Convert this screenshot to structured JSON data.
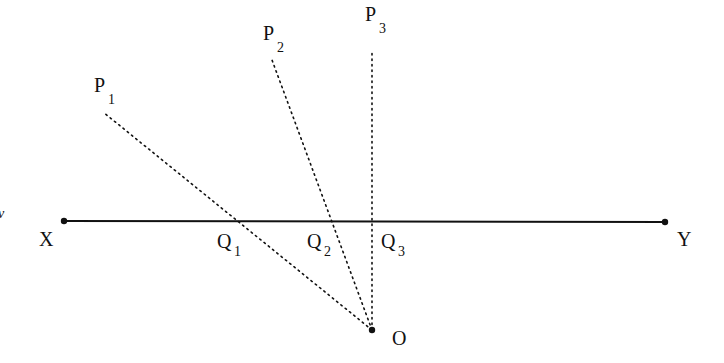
{
  "diagram": {
    "line": {
      "from": "X",
      "to": "Y"
    },
    "points": [
      {
        "name": "X",
        "label": "X"
      },
      {
        "name": "Y",
        "label": "Y"
      },
      {
        "name": "O",
        "label": "O"
      },
      {
        "name": "P1",
        "label": "P",
        "sub": "1"
      },
      {
        "name": "P2",
        "label": "P",
        "sub": "2"
      },
      {
        "name": "P3",
        "label": "P",
        "sub": "3"
      },
      {
        "name": "Q1",
        "label": "Q",
        "sub": "1"
      },
      {
        "name": "Q2",
        "label": "Q",
        "sub": "2"
      },
      {
        "name": "Q3",
        "label": "Q",
        "sub": "3"
      }
    ],
    "edge_fragment": "v"
  }
}
